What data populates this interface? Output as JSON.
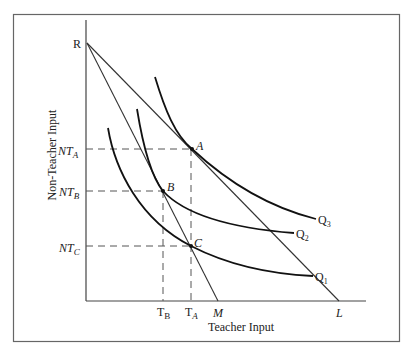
{
  "figure": {
    "y_axis_label": "Non-Teacher Input",
    "x_axis_label": "Teacher Input",
    "intercepts": {
      "vertical": "R",
      "horizontal_steep": "M",
      "horizontal_shallow": "L"
    },
    "points": {
      "A": "A",
      "B": "B",
      "C": "C"
    },
    "y_ticks": [
      {
        "base": "NT",
        "sub": "A"
      },
      {
        "base": "NT",
        "sub": "B"
      },
      {
        "base": "NT",
        "sub": "C"
      }
    ],
    "x_ticks": [
      {
        "base": "T",
        "sub": "B"
      },
      {
        "base": "T",
        "sub": "A"
      }
    ],
    "isoquants": [
      {
        "base": "Q",
        "sub": "3"
      },
      {
        "base": "Q",
        "sub": "2"
      },
      {
        "base": "Q",
        "sub": "1"
      }
    ],
    "colors": {
      "line": "#222222",
      "frame": "#555555",
      "dashed": "#555555"
    }
  }
}
